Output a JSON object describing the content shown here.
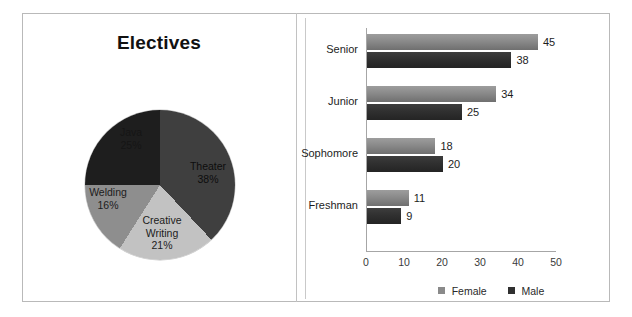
{
  "chart_data": [
    {
      "type": "pie",
      "title": "Electives",
      "categories": [
        "Theater",
        "Creative Writing",
        "Welding",
        "Java"
      ],
      "values": [
        38,
        21,
        16,
        25
      ],
      "value_suffix": "%",
      "labels": [
        {
          "name": "Theater",
          "pct": "38%",
          "color": "#3f3f3f"
        },
        {
          "name": "Creative",
          "name2": "Writing",
          "pct": "21%",
          "color": "#c2c2c2"
        },
        {
          "name": "Welding",
          "pct": "16%",
          "color": "#8e8e8e"
        },
        {
          "name": "Java",
          "pct": "25%",
          "color": "#1e1e1e"
        }
      ],
      "legend": "none",
      "grid": false
    },
    {
      "type": "bar",
      "orientation": "horizontal",
      "title": "",
      "categories": [
        "Senior",
        "Junior",
        "Sophomore",
        "Freshman"
      ],
      "series": [
        {
          "name": "Female",
          "color": "#8a8a8a",
          "values": [
            45,
            34,
            18,
            11
          ]
        },
        {
          "name": "Male",
          "color": "#303030",
          "values": [
            38,
            25,
            20,
            9
          ]
        }
      ],
      "xlabel": "",
      "ylabel": "",
      "xlim": [
        0,
        50
      ],
      "xticks": [
        "0",
        "10",
        "20",
        "30",
        "40",
        "50"
      ],
      "data_labels": true,
      "grid": false,
      "legend_position": "bottom"
    }
  ],
  "pie": {
    "title": "Electives",
    "slices": [
      {
        "label": "Java",
        "pct": "25%",
        "value": 25
      },
      {
        "label": "Theater",
        "pct": "38%",
        "value": 38
      },
      {
        "label": "Creative",
        "label2": "Writing",
        "pct": "21%",
        "value": 21
      },
      {
        "label": "Welding",
        "pct": "16%",
        "value": 16
      }
    ]
  },
  "bars": {
    "groups": [
      {
        "category": "Senior",
        "female": 45,
        "male": 38,
        "female_label": "45",
        "male_label": "38"
      },
      {
        "category": "Junior",
        "female": 34,
        "male": 25,
        "female_label": "34",
        "male_label": "25"
      },
      {
        "category": "Sophomore",
        "female": 18,
        "male": 20,
        "female_label": "18",
        "male_label": "20"
      },
      {
        "category": "Freshman",
        "female": 11,
        "male": 9,
        "female_label": "11",
        "male_label": "9"
      }
    ],
    "xticks": [
      "0",
      "10",
      "20",
      "30",
      "40",
      "50"
    ],
    "legend": [
      {
        "label": "Female",
        "color": "#8a8a8a"
      },
      {
        "label": "Male",
        "color": "#303030"
      }
    ]
  },
  "colors": {
    "female": "#8a8a8a",
    "male": "#303030",
    "pie_theater": "#3f3f3f",
    "pie_creative": "#c2c2c2",
    "pie_welding": "#8e8e8e",
    "pie_java": "#1e1e1e",
    "frame": "#b9b9b9"
  }
}
